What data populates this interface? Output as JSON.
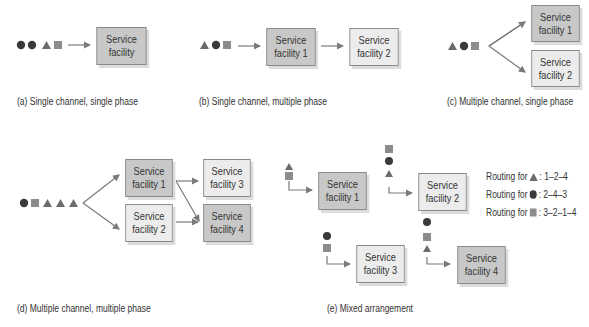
{
  "colors": {
    "circle": "#3a3a3a",
    "triangle": "#6b6b6b",
    "square": "#8c8c8c",
    "dark_box": "#c8c8c8",
    "light_box": "#ececec",
    "arrow": "#7a7a7a"
  },
  "panels": {
    "a": {
      "caption": "(a) Single channel, single phase",
      "queue": [
        "circle",
        "circle",
        "triangle",
        "square"
      ],
      "facilities": [
        {
          "label1": "Service",
          "label2": "facility",
          "shade": "dark"
        }
      ]
    },
    "b": {
      "caption": "(b) Single channel, multiple phase",
      "queue": [
        "triangle",
        "circle",
        "square"
      ],
      "facilities": [
        {
          "label1": "Service",
          "label2": "facility 1",
          "shade": "dark"
        },
        {
          "label1": "Service",
          "label2": "facility 2",
          "shade": "light"
        }
      ]
    },
    "c": {
      "caption": "(c) Multiple channel, single phase",
      "queue": [
        "triangle",
        "circle",
        "square"
      ],
      "facilities": [
        {
          "label1": "Service",
          "label2": "facility 1",
          "shade": "dark"
        },
        {
          "label1": "Service",
          "label2": "facility 2",
          "shade": "light"
        }
      ]
    },
    "d": {
      "caption": "(d) Multiple channel, multiple phase",
      "queue": [
        "circle",
        "square",
        "triangle",
        "triangle",
        "triangle"
      ],
      "facilities": [
        {
          "label1": "Service",
          "label2": "facility 1",
          "shade": "dark"
        },
        {
          "label1": "Service",
          "label2": "facility 2",
          "shade": "light"
        },
        {
          "label1": "Service",
          "label2": "facility 3",
          "shade": "light"
        },
        {
          "label1": "Service",
          "label2": "facility 4",
          "shade": "dark"
        }
      ]
    },
    "e": {
      "caption": "(e) Mixed arrangement",
      "facilities": [
        {
          "label1": "Service",
          "label2": "facility 1",
          "shade": "dark",
          "queue": [
            "triangle",
            "square"
          ]
        },
        {
          "label1": "Service",
          "label2": "facility 2",
          "shade": "light",
          "queue": [
            "square",
            "circle",
            "triangle"
          ]
        },
        {
          "label1": "Service",
          "label2": "facility 3",
          "shade": "light",
          "queue": [
            "circle",
            "square"
          ]
        },
        {
          "label1": "Service",
          "label2": "facility 4",
          "shade": "dark",
          "queue": [
            "circle",
            "square",
            "triangle"
          ]
        }
      ],
      "legend": [
        {
          "prefix": "Routing for",
          "shape": "triangle",
          "route": ": 1–2–4"
        },
        {
          "prefix": "Routing for",
          "shape": "circle",
          "route": ": 2–4–3"
        },
        {
          "prefix": "Routing for",
          "shape": "square",
          "route": ": 3–2–1–4"
        }
      ]
    }
  }
}
